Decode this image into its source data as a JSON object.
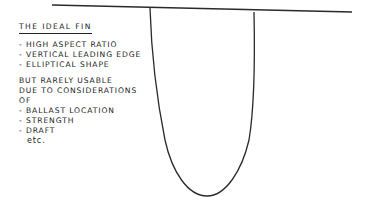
{
  "diagram": {
    "title": "THE IDEAL FIN",
    "ideal_features": [
      "- HIGH ASPECT RATIO",
      "- VERTICAL LEADING EDGE",
      "- ELLIPTICAL SHAPE"
    ],
    "caveat_lines": [
      "BUT RARELY USABLE",
      "DUE TO CONSIDERATIONS",
      "OF"
    ],
    "considerations": [
      "- BALLAST LOCATION",
      "- STRENGTH",
      "- DRAFT"
    ],
    "trailing": "etc.",
    "shapes": {
      "hull_line": "hull bottom line",
      "fin": "elliptical fin outline"
    },
    "stroke_color": "#2a2a2a"
  }
}
